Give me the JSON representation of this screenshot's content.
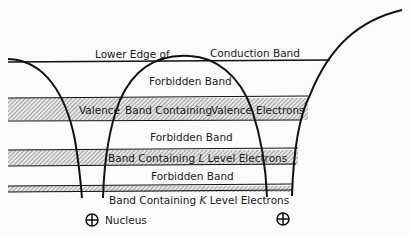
{
  "diagram": {
    "labels": {
      "conduction_left": "Lower Edge of",
      "conduction_right": "Conduction Band",
      "forbidden_1": "Forbidden Band",
      "valence": "Valence Band Containing Valence Electrons",
      "valence_a": "Valence",
      "valence_b": "Band Containing",
      "valence_c": "Valence",
      "valence_d": "Electrons",
      "forbidden_2": "Forbidden Band",
      "l_band_a": "Band Containing ",
      "l_band_letter": "L",
      "l_band_b": " Level Electrons",
      "forbidden_3": "Forbidden Band",
      "k_band_a": "Band Containing ",
      "k_band_letter": "K",
      "k_band_b": " Level Electrons",
      "nucleus": "Nucleus"
    },
    "colors": {
      "line": "#111111",
      "hatch": "#8a8a8a",
      "background": "#fbfbfb"
    }
  }
}
